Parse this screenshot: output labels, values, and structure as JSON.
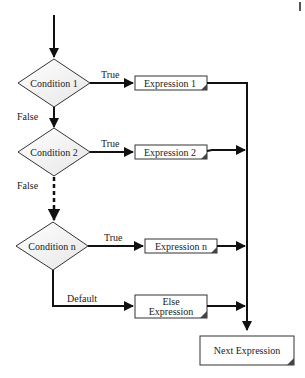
{
  "diagram": {
    "type": "flowchart",
    "conditions": [
      {
        "label": "Condition 1",
        "true_label": "True",
        "false_label": "False",
        "expression": "Expression 1"
      },
      {
        "label": "Condition 2",
        "true_label": "True",
        "false_label": "False",
        "expression": "Expression 2"
      },
      {
        "label": "Condition n",
        "true_label": "True",
        "expression": "Expression n"
      }
    ],
    "default": {
      "label": "Default",
      "expression_line1": "Else",
      "expression_line2": "Expression"
    },
    "next": {
      "label": "Next Expression"
    },
    "colors": {
      "line": "#111111",
      "diamond_fill": "#f4f4f4",
      "box_fill": "#ffffff",
      "shadow": "#444444"
    }
  }
}
